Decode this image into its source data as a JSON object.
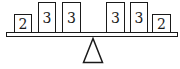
{
  "diagram": {
    "type": "balance-scale",
    "stroke_color": "#1a1a1a",
    "fill_color": "#ffffff",
    "left_side": {
      "boxes": [
        {
          "label": "2",
          "size": "short"
        },
        {
          "label": "3",
          "size": "tall"
        },
        {
          "label": "3",
          "size": "tall"
        }
      ]
    },
    "right_side": {
      "boxes": [
        {
          "label": "3",
          "size": "tall"
        },
        {
          "label": "3",
          "size": "tall"
        },
        {
          "label": "2",
          "size": "short"
        }
      ]
    },
    "fulcrum": {
      "shape": "triangle"
    }
  }
}
